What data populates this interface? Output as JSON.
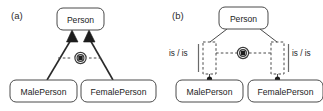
{
  "figure": {
    "panels": [
      {
        "id": "a",
        "label": "(a)",
        "super_class": "Person",
        "sub_classes": [
          "MalePerson",
          "FemalePerson"
        ],
        "constraint_symbol": "xor-constraint-icon",
        "relation_labels": []
      },
      {
        "id": "b",
        "label": "(b)",
        "super_class": "Person",
        "sub_classes": [
          "MalePerson",
          "FemalePerson"
        ],
        "constraint_symbol": "xor-constraint-icon",
        "relation_labels": [
          "is / is",
          "is / is"
        ]
      }
    ]
  },
  "colors": {
    "background": "#ffffff",
    "box_border": "#4a4a4a",
    "generalization": "#2a2a2a",
    "dashed": "#4a4a4a",
    "text": "#1c1c1c"
  }
}
